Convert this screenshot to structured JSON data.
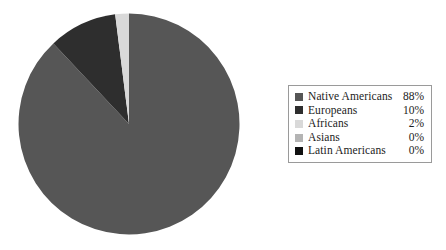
{
  "chart_data": {
    "type": "pie",
    "title": "",
    "categories": [
      "Native Americans",
      "Europeans",
      "Africans",
      "Asians",
      "Latin Americans"
    ],
    "values": [
      88,
      10,
      2,
      0,
      0
    ],
    "value_labels": [
      "88%",
      "10%",
      "2%",
      "0%",
      "0%"
    ],
    "unit": "%",
    "start_angle_deg": 0,
    "direction": "clockwise",
    "legend_position": "right",
    "grid": false,
    "slice_order_from_top_clockwise": [
      "Native Americans",
      "Europeans",
      "Africans"
    ],
    "colors": {
      "native_americans": "#565656",
      "europeans": "#2e2e2e",
      "africans": "#d9d9d9",
      "asians": "#b4b4b4",
      "latin_americans": "#111111"
    }
  },
  "pie": {
    "name": "population-composition-pie",
    "slices": [
      {
        "name": "Native Americans",
        "value": 88,
        "color": "#565656"
      },
      {
        "name": "Europeans",
        "value": 10,
        "color": "#2e2e2e"
      },
      {
        "name": "Africans",
        "value": 2,
        "color": "#d9d9d9"
      },
      {
        "name": "Asians",
        "value": 0,
        "color": "#b4b4b4"
      },
      {
        "name": "Latin Americans",
        "value": 0,
        "color": "#111111"
      }
    ]
  },
  "legend": {
    "border_color": "#9a9a9a",
    "rows": [
      {
        "label": "Native Americans",
        "value": "88%",
        "color": "#565656"
      },
      {
        "label": "Europeans",
        "value": "10%",
        "color": "#2e2e2e"
      },
      {
        "label": "Africans",
        "value": "2%",
        "color": "#d9d9d9"
      },
      {
        "label": "Asians",
        "value": "0%",
        "color": "#b4b4b4"
      },
      {
        "label": "Latin Americans",
        "value": "0%",
        "color": "#111111"
      }
    ]
  }
}
